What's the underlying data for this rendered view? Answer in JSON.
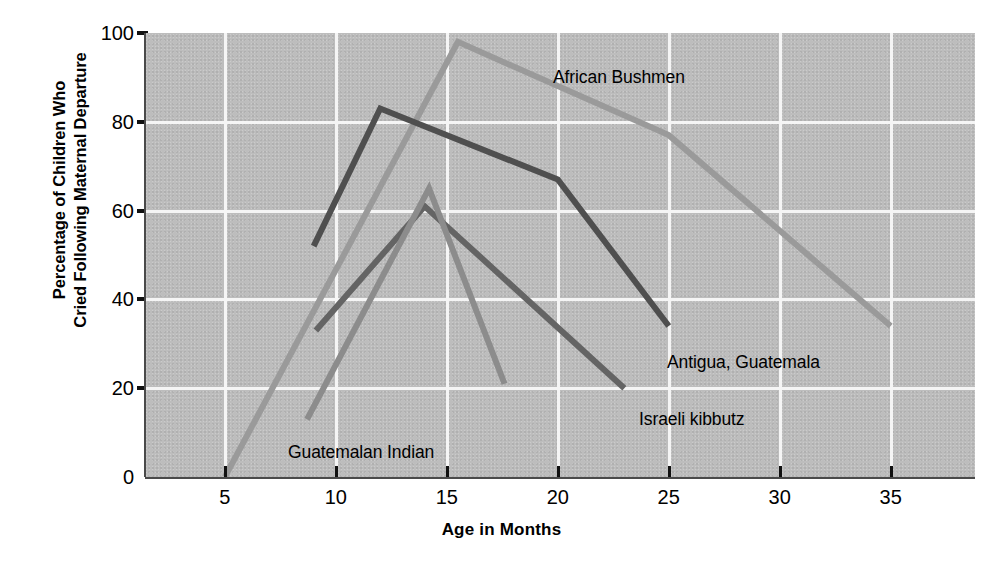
{
  "chart_data": {
    "type": "line",
    "title": "",
    "xlabel": "Age in Months",
    "ylabel": "Percentage of Children Who\nCried Following Maternal Departure",
    "xlim": [
      1.4,
      38.8
    ],
    "ylim": [
      0,
      100
    ],
    "xticks": [
      5,
      10,
      15,
      20,
      25,
      30,
      35
    ],
    "yticks": [
      0,
      20,
      40,
      60,
      80,
      100
    ],
    "grid": true,
    "legend_position": "inline-annotations",
    "plot_background": "#bdbdbd",
    "gridline_color": "#f5f5f5",
    "series": [
      {
        "name": "African Bushmen",
        "color": "#9a9a9a",
        "label_x_px": 553,
        "label_y_px": 67,
        "points": [
          {
            "x": 5.0,
            "y": 0
          },
          {
            "x": 15.5,
            "y": 98
          },
          {
            "x": 25.0,
            "y": 77
          },
          {
            "x": 35.0,
            "y": 34
          }
        ]
      },
      {
        "name": "Antigua, Guatemala",
        "color": "#4f4f4f",
        "label_x_px": 667,
        "label_y_px": 352,
        "points": [
          {
            "x": 9.0,
            "y": 52
          },
          {
            "x": 12.0,
            "y": 83
          },
          {
            "x": 20.0,
            "y": 67
          },
          {
            "x": 25.0,
            "y": 34
          }
        ]
      },
      {
        "name": "Israeli kibbutz",
        "color": "#646464",
        "label_x_px": 639,
        "label_y_px": 409,
        "points": [
          {
            "x": 9.1,
            "y": 33
          },
          {
            "x": 14.0,
            "y": 61
          },
          {
            "x": 23.0,
            "y": 20
          }
        ]
      },
      {
        "name": "Guatemalan Indian",
        "color": "#8c8c8c",
        "label_x_px": 288,
        "label_y_px": 442,
        "points": [
          {
            "x": 8.7,
            "y": 13
          },
          {
            "x": 14.2,
            "y": 65
          },
          {
            "x": 17.6,
            "y": 21
          }
        ]
      }
    ]
  }
}
